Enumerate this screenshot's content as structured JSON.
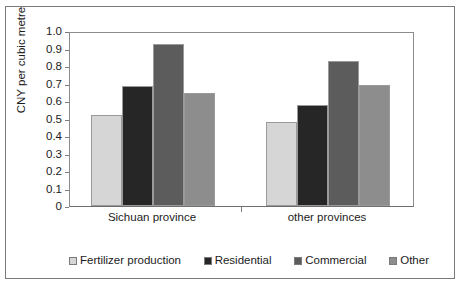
{
  "chart_data": {
    "type": "bar",
    "title": "",
    "subtitle": "",
    "xlabel": "",
    "ylabel": "CNY per cubic metre",
    "categories": [
      "Sichuan province",
      "other provinces"
    ],
    "series": [
      {
        "name": "Fertilizer production",
        "color": "#d6d6d6",
        "values": [
          0.52,
          0.48
        ]
      },
      {
        "name": "Residential",
        "color": "#262626",
        "values": [
          0.685,
          0.58
        ]
      },
      {
        "name": "Commercial",
        "color": "#5c5c5c",
        "values": [
          0.925,
          0.83
        ]
      },
      {
        "name": "Other",
        "color": "#8d8d8d",
        "values": [
          0.645,
          0.69
        ]
      }
    ],
    "ylim": [
      0,
      1.0
    ],
    "ytick_labels": [
      "1.0",
      "0.9",
      "0.8",
      "0.7",
      "0.6",
      "0.5",
      "0.4",
      "0.3",
      "0.2",
      "0.1",
      "0"
    ],
    "ytick_values": [
      1.0,
      0.9,
      0.8,
      0.7,
      0.6,
      0.5,
      0.4,
      0.3,
      0.2,
      0.1,
      0
    ],
    "grid": false,
    "legend_position": "bottom",
    "grouped": true,
    "bar_gap_within_group": 0,
    "frame": true
  },
  "legend": {
    "items": [
      {
        "label": "Fertilizer production",
        "color": "#d6d6d6"
      },
      {
        "label": "Residential",
        "color": "#262626"
      },
      {
        "label": "Commercial",
        "color": "#5c5c5c"
      },
      {
        "label": "Other",
        "color": "#8d8d8d"
      }
    ]
  }
}
